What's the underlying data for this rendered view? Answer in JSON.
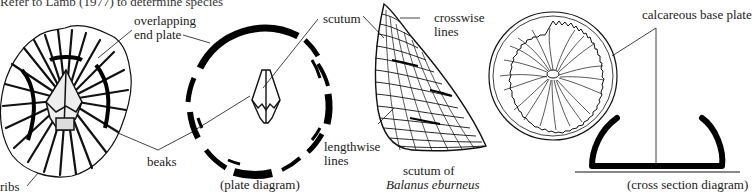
{
  "header": {
    "cropped_text": "Refer to Lamb (1977) to determine species"
  },
  "figures": {
    "barnacle_top_view": {
      "labels": {
        "overlapping_end_plate_1": "overlapping",
        "overlapping_end_plate_2": "end plate",
        "beaks": "beaks",
        "ribs": "ribs"
      }
    },
    "plate_diagram": {
      "labels": {
        "scutum": "scutum",
        "caption": "(plate diagram)"
      }
    },
    "scutum_detail": {
      "labels": {
        "crosswise_1": "crosswise",
        "crosswise_2": "lines",
        "lengthwise_1": "lengthwise",
        "lengthwise_2": "lines",
        "caption_1": "scutum of",
        "caption_2": "Balanus eburneus"
      }
    },
    "base_plate": {
      "labels": {
        "calcareous": "calcareous base plate",
        "caption": "(cross section diagram)"
      }
    }
  },
  "colors": {
    "ink": "#111111",
    "background": "#ffffff"
  }
}
